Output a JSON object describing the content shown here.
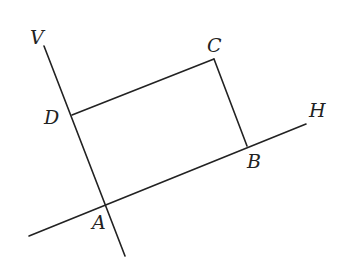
{
  "diagram": {
    "type": "geometry",
    "colors": {
      "stroke": "#222222",
      "background": "#ffffff"
    },
    "points": {
      "A": {
        "label": "A",
        "x": 106,
        "y": 203
      },
      "B": {
        "label": "B",
        "x": 247,
        "y": 146
      },
      "C": {
        "label": "C",
        "x": 214,
        "y": 59
      },
      "D": {
        "label": "D",
        "x": 72,
        "y": 115
      }
    },
    "lines": {
      "V": {
        "label": "V",
        "x1": 44,
        "y1": 46,
        "x2": 125,
        "y2": 256
      },
      "H": {
        "label": "H",
        "x1": 29,
        "y1": 236,
        "x2": 306,
        "y2": 124
      }
    },
    "segments": [
      {
        "from": "D",
        "to": "C"
      },
      {
        "from": "C",
        "to": "B"
      }
    ],
    "labels": {
      "V": {
        "text": "V",
        "x": 30,
        "y": 44
      },
      "C": {
        "text": "C",
        "x": 207,
        "y": 52
      },
      "D": {
        "text": "D",
        "x": 44,
        "y": 124
      },
      "B": {
        "text": "B",
        "x": 247,
        "y": 168
      },
      "H": {
        "text": "H",
        "x": 309,
        "y": 117
      },
      "A": {
        "text": "A",
        "x": 92,
        "y": 229
      }
    }
  }
}
